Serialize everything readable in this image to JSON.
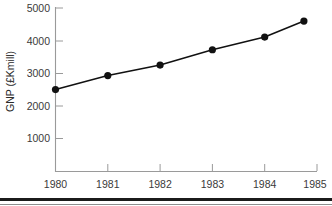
{
  "chart_data": {
    "type": "line",
    "title": "",
    "xlabel": "",
    "ylabel": "GNP (£Kmill)",
    "xlim": [
      1980,
      1985
    ],
    "ylim": [
      0,
      5000
    ],
    "grid": false,
    "legend": "none",
    "x_ticks": [
      "1980",
      "1981",
      "1982",
      "1983",
      "1984",
      "1985"
    ],
    "x_tick_values": [
      1980,
      1981,
      1982,
      1983,
      1984,
      1985
    ],
    "y_ticks": [
      "1000",
      "2000",
      "3000",
      "4000",
      "5000"
    ],
    "y_tick_values": [
      1000,
      2000,
      3000,
      4000,
      5000
    ],
    "series": [
      {
        "name": "GNP",
        "marker": "filled-circle",
        "x": [
          1980,
          1981,
          1982,
          1983,
          1984,
          1984.75
        ],
        "values": [
          2500,
          2930,
          3250,
          3720,
          4110,
          4600
        ]
      }
    ]
  },
  "axes": {
    "y_title": "GNP (£Kmill)"
  },
  "footer": {
    "rule": ""
  }
}
